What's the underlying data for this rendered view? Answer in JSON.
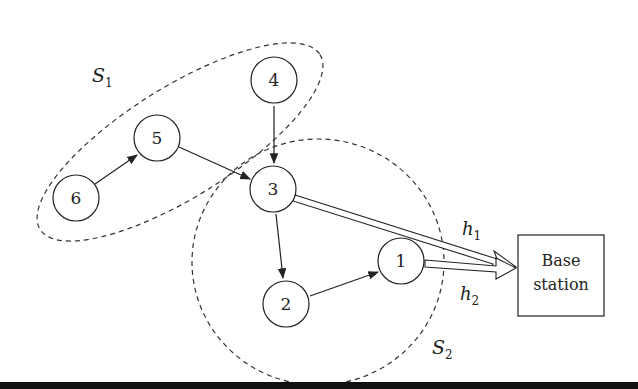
{
  "diagram": {
    "nodes": [
      {
        "id": "1",
        "label": "1",
        "x": 401,
        "y": 290
      },
      {
        "id": "2",
        "label": "2",
        "x": 286,
        "y": 303
      },
      {
        "id": "3",
        "label": "3",
        "x": 273,
        "y": 188
      },
      {
        "id": "4",
        "label": "4",
        "x": 274,
        "y": 80
      },
      {
        "id": "5",
        "label": "5",
        "x": 157,
        "y": 138
      },
      {
        "id": "6",
        "label": "6",
        "x": 76,
        "y": 197
      }
    ],
    "edges": [
      {
        "from": "6",
        "to": "5"
      },
      {
        "from": "5",
        "to": "3"
      },
      {
        "from": "4",
        "to": "3"
      },
      {
        "from": "3",
        "to": "2"
      },
      {
        "from": "2",
        "to": "1"
      }
    ],
    "uplinks": [
      {
        "from": "3",
        "to": "base",
        "label": "h",
        "sub": "1"
      },
      {
        "from": "1",
        "to": "base",
        "label": "h",
        "sub": "2"
      }
    ],
    "base_station": {
      "line1": "Base",
      "line2": "station"
    },
    "clusters": [
      {
        "label": "S",
        "sub": "1"
      },
      {
        "label": "S",
        "sub": "2"
      }
    ]
  }
}
